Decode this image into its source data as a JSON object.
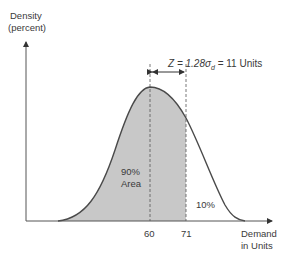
{
  "diagram": {
    "y_axis_label_line1": "Density",
    "y_axis_label_line2": "(percent)",
    "x_axis_label_line1": "Demand",
    "x_axis_label_line2": "in Units",
    "annotation_z_prefix": "Z = 1.28",
    "annotation_sigma": "σ",
    "annotation_sigma_sub": "d",
    "annotation_suffix": " = 11 Units",
    "area_label_line1": "90%",
    "area_label_line2": "Area",
    "tail_label": "10%",
    "tick_mean": "60",
    "tick_z": "71",
    "colors": {
      "shade": "#c8c8c8",
      "curve": "#4a4a4a",
      "axis": "#555555"
    }
  }
}
